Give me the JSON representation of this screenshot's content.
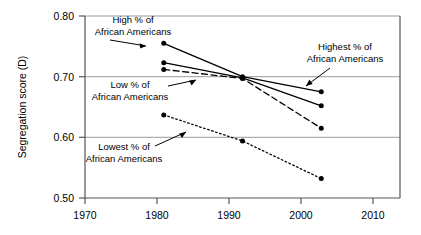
{
  "chart_data": {
    "type": "line",
    "title": "",
    "subtitle": "",
    "xlabel": "",
    "ylabel": "Segregation score (D)",
    "x": [
      1980,
      1990,
      2000
    ],
    "xlim": [
      1970,
      2010
    ],
    "ylim": [
      0.5,
      0.8
    ],
    "xticks": [
      "1970",
      "1980",
      "1990",
      "2000",
      "2010"
    ],
    "xtick_values": [
      1970,
      1980,
      1990,
      2000,
      2010
    ],
    "yticks": [
      "0.50",
      "0.60",
      "0.70",
      "0.80"
    ],
    "ytick_values": [
      0.5,
      0.6,
      0.7,
      0.8
    ],
    "grid": true,
    "grid_axis": "y",
    "legend_position": "annotations-inline",
    "series": [
      {
        "name": "High % of African Americans",
        "values": [
          0.755,
          0.7,
          0.675
        ],
        "line_style": "solid",
        "color": "#000000",
        "marker": "circle"
      },
      {
        "name": "Highest % of African Americans",
        "values": [
          0.723,
          0.698,
          0.652
        ],
        "line_style": "solid",
        "color": "#000000",
        "marker": "circle"
      },
      {
        "name": "Low % of African Americans",
        "values": [
          0.712,
          0.697,
          0.615
        ],
        "line_style": "dashed",
        "color": "#000000",
        "marker": "circle"
      },
      {
        "name": "Lowest % of African Americans",
        "values": [
          0.637,
          0.594,
          0.532
        ],
        "line_style": "dotted",
        "color": "#000000",
        "marker": "circle"
      }
    ],
    "annotations": [
      {
        "id": "high",
        "line1": "High % of",
        "line2": "African Americans"
      },
      {
        "id": "low",
        "line1": "Low % of",
        "line2": "African Americans"
      },
      {
        "id": "lowest",
        "line1": "Lowest % of",
        "line2": "African Americans"
      },
      {
        "id": "highest",
        "line1": "Highest % of",
        "line2": "African Americans"
      }
    ]
  },
  "axes": {
    "ylabel": "Segregation score (D)",
    "ytick_0": "0.50",
    "ytick_1": "0.60",
    "ytick_2": "0.70",
    "ytick_3": "0.80",
    "xtick_0": "1970",
    "xtick_1": "1980",
    "xtick_2": "1990",
    "xtick_3": "2000",
    "xtick_4": "2010"
  },
  "annotations": {
    "high_l1": "High % of",
    "high_l2": "African Americans",
    "low_l1": "Low % of",
    "low_l2": "African Americans",
    "lowest_l1": "Lowest % of",
    "lowest_l2": "African Americans",
    "highest_l1": "Highest % of",
    "highest_l2": "African Americans"
  },
  "colors": {
    "line": "#000000",
    "grid": "#9a9a9a",
    "axis": "#555555",
    "background": "#ffffff"
  }
}
